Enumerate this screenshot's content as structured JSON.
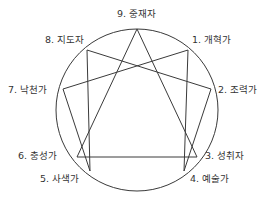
{
  "colors": {
    "line": "#3a3a3a",
    "text": "#333333",
    "background": "#ffffff"
  },
  "circle": {
    "cx": 137,
    "cy": 110,
    "r": 81
  },
  "points": [
    {
      "id": 9,
      "label": "9. 중재자",
      "x": 137,
      "y": 29
    },
    {
      "id": 1,
      "label": "1. 개혁가",
      "x": 188,
      "y": 50
    },
    {
      "id": 2,
      "label": "2. 조력가",
      "x": 211,
      "y": 89
    },
    {
      "id": 3,
      "label": "3. 성취자",
      "x": 197,
      "y": 157
    },
    {
      "id": 4,
      "label": "4. 예술가",
      "x": 184,
      "y": 171
    },
    {
      "id": 5,
      "label": "5. 사색가",
      "x": 90,
      "y": 171
    },
    {
      "id": 6,
      "label": "6. 충성가",
      "x": 77,
      "y": 157
    },
    {
      "id": 7,
      "label": "7. 낙천가",
      "x": 63,
      "y": 89
    },
    {
      "id": 8,
      "label": "8. 지도자",
      "x": 87,
      "y": 50
    }
  ],
  "labels": {
    "p9": "9. 중재자",
    "p1": "1. 개혁가",
    "p2": "2. 조력가",
    "p3": "3. 성취자",
    "p4": "4. 예술가",
    "p5": "5. 사색가",
    "p6": "6. 충성가",
    "p7": "7. 낙천가",
    "p8": "8. 지도자"
  },
  "triangle": [
    9,
    3,
    6
  ],
  "hexad": [
    1,
    4,
    2,
    8,
    5,
    7
  ]
}
